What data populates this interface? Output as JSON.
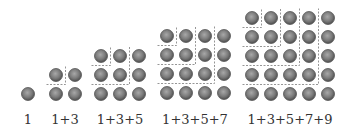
{
  "diagram": {
    "dot_color": "#7a7a7a",
    "dot_edge_color": "#555555",
    "dash_color": "#8a8a8a",
    "groups": [
      {
        "label": "1",
        "n": 1,
        "label_x": 28,
        "origin_x": 28,
        "bottom_y": 94
      },
      {
        "label": "1+3",
        "n": 2,
        "label_x": 65,
        "origin_x": 56,
        "bottom_y": 94
      },
      {
        "label": "1+3+5",
        "n": 3,
        "label_x": 120,
        "origin_x": 101,
        "bottom_y": 94
      },
      {
        "label": "1+3+5+7",
        "n": 4,
        "label_x": 195,
        "origin_x": 167,
        "bottom_y": 93
      },
      {
        "label": "1+3+5+7+9",
        "n": 5,
        "label_x": 290,
        "origin_x": 252,
        "bottom_y": 94
      }
    ],
    "spacing": 19,
    "dot_radius": 6.5
  }
}
